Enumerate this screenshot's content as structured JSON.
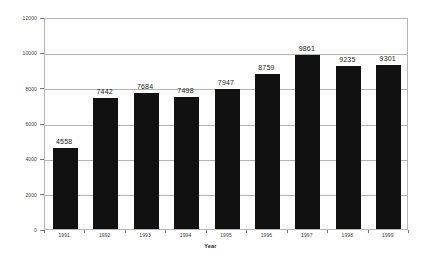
{
  "chart_data": {
    "type": "bar",
    "title": "",
    "subtitle": "",
    "xlabel": "Year",
    "ylabel": "",
    "categories": [
      "1991",
      "1992",
      "1993",
      "1994",
      "1995",
      "1996",
      "1997",
      "1998",
      "1999"
    ],
    "values": [
      4558,
      7442,
      7684,
      7498,
      7947,
      8759,
      9861,
      9235,
      9301
    ],
    "series": [
      {
        "name": "",
        "values": [
          4558,
          7442,
          7684,
          7498,
          7947,
          8759,
          9861,
          9235,
          9301
        ]
      }
    ],
    "data_labels": [
      "4558",
      "7442",
      "7684",
      "7498",
      "7947",
      "8759",
      "9861",
      "9235",
      "9301"
    ],
    "ylim": [
      0,
      12000
    ],
    "yticks": [
      0,
      2000,
      4000,
      6000,
      8000,
      10000,
      12000
    ],
    "ytick_labels": [
      "0",
      "2000",
      "4000",
      "6000",
      "8000",
      "10000",
      "12000"
    ],
    "grid": "horizontal",
    "legend": "none",
    "bar_color": "#111111",
    "grid_color": "#b4b4b4",
    "plot_border_color": "#b4b4b4",
    "background_color": "#ffffff"
  }
}
